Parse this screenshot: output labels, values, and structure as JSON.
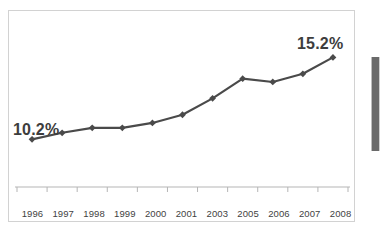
{
  "chart_data": {
    "type": "line",
    "title": "",
    "xlabel": "",
    "ylabel": "",
    "categories": [
      "1996",
      "1997",
      "1998",
      "1999",
      "2000",
      "2001",
      "2003",
      "2005",
      "2006",
      "2007",
      "2008"
    ],
    "values": [
      10.2,
      10.6,
      10.9,
      10.9,
      11.2,
      11.7,
      12.7,
      13.9,
      13.7,
      14.2,
      15.2
    ],
    "series": [
      {
        "name": "Percent",
        "values": [
          10.2,
          10.6,
          10.9,
          10.9,
          11.2,
          11.7,
          12.7,
          13.9,
          13.7,
          14.2,
          15.2
        ]
      }
    ],
    "ylim": [
      9.0,
      16.2
    ],
    "grid": false,
    "legend": false,
    "legend_position": "none",
    "marker": "diamond",
    "line_color": "#4a4a4a",
    "marker_color": "#4a4a4a",
    "annotations": [
      {
        "name": "start-value",
        "text": "10.2%",
        "category": "1996",
        "value": 10.2
      },
      {
        "name": "end-value",
        "text": "15.2%",
        "category": "2008",
        "value": 15.2
      }
    ]
  },
  "axis": {
    "line_color": "#b5b5b5",
    "tick_labels": [
      "1996",
      "1997",
      "1998",
      "1999",
      "2000",
      "2001",
      "2003",
      "2005",
      "2006",
      "2007",
      "2008"
    ]
  },
  "frame": {
    "border_color": "#d2d2d2",
    "background": "#ffffff"
  },
  "artifact": {
    "name": "scan-edge-bar",
    "color": "#6a6a6a"
  }
}
